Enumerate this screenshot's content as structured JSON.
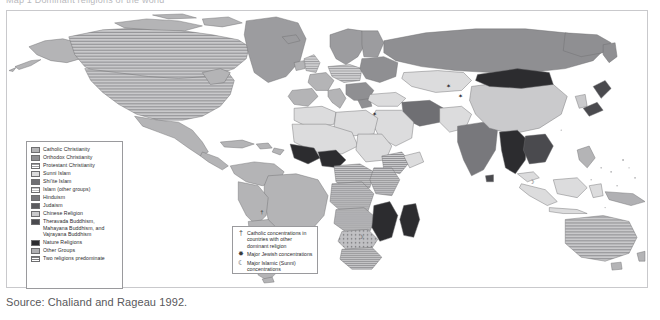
{
  "title_strip": {
    "text": "Map 1  Dominant religions of the world"
  },
  "map": {
    "name": "world-religions-map",
    "projection": "equirectangular",
    "background": "#ffffff",
    "border_color": "#c9c9cc",
    "ocean_color": "#ffffff",
    "country_border_color": "#6e6e70"
  },
  "legend": {
    "name": "religion-legend",
    "items": [
      {
        "label": "Catholic Christianity",
        "color": "#b4b4b6",
        "pattern": "solid"
      },
      {
        "label": "Orthodox Christianity",
        "color": "#8f8f92",
        "pattern": "solid"
      },
      {
        "label": "Protestant Christianity",
        "color": "#9c9c9f",
        "pattern": "hlines"
      },
      {
        "label": "Sunni Islam",
        "color": "#dcdcdd",
        "pattern": "solid"
      },
      {
        "label": "Shi'ite Islam",
        "color": "#6f6f73",
        "pattern": "solid"
      },
      {
        "label": "Islam (other groups)",
        "color": "#c2c2c4",
        "pattern": "hlines"
      },
      {
        "label": "Hinduism",
        "color": "#78787c",
        "pattern": "solid"
      },
      {
        "label": "Judaism",
        "color": "#5a5a5e",
        "pattern": "solid"
      },
      {
        "label": "Chinese Religion",
        "color": "#cacacc",
        "pattern": "solid"
      },
      {
        "label": "Theravada Buddhism, Mahayana Buddhism, and Vajrayana Buddhism",
        "color": "#4a4a4e",
        "pattern": "solid"
      },
      {
        "label": "Nature Religions",
        "color": "#2c2c2f",
        "pattern": "solid"
      },
      {
        "label": "Other Groups",
        "color": "#b0b0b3",
        "pattern": "solid"
      },
      {
        "label": "Two religions predominate",
        "color": "#bfbfc2",
        "pattern": "hlines-dense"
      }
    ]
  },
  "symbol_legend": {
    "name": "concentration-legend",
    "items": [
      {
        "glyph": "†",
        "icon": "cross-icon",
        "label": "Catholic concentrations in countries with other dominant religion"
      },
      {
        "glyph": "✸",
        "icon": "star-of-david-icon",
        "label": "Major Jewish concentrations"
      },
      {
        "glyph": "☾",
        "icon": "crescent-icon",
        "label": "Major Islamic (Sunni) concentrations"
      }
    ]
  },
  "source": {
    "text": "Source: Chaliand and Rageau 1992."
  }
}
